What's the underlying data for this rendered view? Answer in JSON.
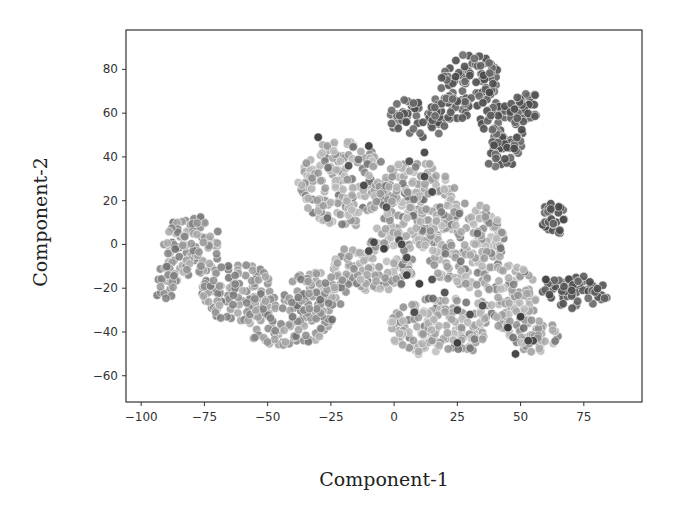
{
  "chart_data": {
    "type": "scatter",
    "title": "",
    "xlabel": "Component-1",
    "ylabel": "Component-2",
    "xlim": [
      -106,
      98
    ],
    "ylim": [
      -72,
      98
    ],
    "xticks": [
      -100,
      -75,
      -50,
      -25,
      0,
      25,
      50,
      75
    ],
    "xtick_labels": [
      "−100",
      "−75",
      "−50",
      "−25",
      "0",
      "25",
      "50",
      "75"
    ],
    "yticks": [
      -60,
      -40,
      -20,
      0,
      20,
      40,
      60,
      80
    ],
    "ytick_labels": [
      "−60",
      "−40",
      "−20",
      "0",
      "20",
      "40",
      "60",
      "80"
    ],
    "grid": false,
    "legend": null,
    "colormap": "grayscale",
    "marker_size": 6.5,
    "clusters": [
      {
        "name": "top-right dark cluster",
        "shade": "dark",
        "regions": [
          {
            "cx": 10,
            "cy": 58,
            "rx": 12,
            "ry": 10,
            "n": 55
          },
          {
            "cx": 30,
            "cy": 75,
            "rx": 12,
            "ry": 12,
            "n": 80
          },
          {
            "cx": 42,
            "cy": 50,
            "rx": 9,
            "ry": 16,
            "n": 80
          },
          {
            "cx": 52,
            "cy": 62,
            "rx": 7,
            "ry": 8,
            "n": 30
          },
          {
            "cx": 22,
            "cy": 62,
            "rx": 8,
            "ry": 6,
            "n": 30
          }
        ]
      },
      {
        "name": "right small dark cluster",
        "shade": "dark",
        "regions": [
          {
            "cx": 63,
            "cy": 12,
            "rx": 5,
            "ry": 8,
            "n": 28
          }
        ]
      },
      {
        "name": "far-right dark cluster",
        "shade": "dark",
        "regions": [
          {
            "cx": 72,
            "cy": -22,
            "rx": 14,
            "ry": 8,
            "n": 60
          }
        ]
      },
      {
        "name": "central light cluster",
        "shade": "light",
        "regions": [
          {
            "cx": -20,
            "cy": 28,
            "rx": 18,
            "ry": 20,
            "n": 190
          },
          {
            "cx": 8,
            "cy": 18,
            "rx": 18,
            "ry": 20,
            "n": 190
          },
          {
            "cx": 28,
            "cy": 0,
            "rx": 16,
            "ry": 20,
            "n": 170
          },
          {
            "cx": -8,
            "cy": -10,
            "rx": 16,
            "ry": 12,
            "n": 110
          },
          {
            "cx": 18,
            "cy": -38,
            "rx": 20,
            "ry": 14,
            "n": 160
          },
          {
            "cx": 45,
            "cy": -25,
            "rx": 12,
            "ry": 16,
            "n": 90
          },
          {
            "cx": 55,
            "cy": -42,
            "rx": 10,
            "ry": 8,
            "n": 40
          }
        ]
      },
      {
        "name": "left light cluster",
        "shade": "mid",
        "regions": [
          {
            "cx": -80,
            "cy": 0,
            "rx": 12,
            "ry": 14,
            "n": 100
          },
          {
            "cx": -90,
            "cy": -18,
            "rx": 5,
            "ry": 8,
            "n": 25
          },
          {
            "cx": -62,
            "cy": -22,
            "rx": 14,
            "ry": 14,
            "n": 110
          },
          {
            "cx": -42,
            "cy": -35,
            "rx": 18,
            "ry": 12,
            "n": 110
          },
          {
            "cx": -30,
            "cy": -22,
            "rx": 12,
            "ry": 10,
            "n": 60
          }
        ]
      }
    ],
    "highlighted_dark_points": [
      [
        -30,
        49
      ],
      [
        -18,
        36
      ],
      [
        -12,
        27
      ],
      [
        -3,
        17
      ],
      [
        -10,
        45
      ],
      [
        12,
        42
      ],
      [
        -8,
        1
      ],
      [
        -4,
        -2
      ],
      [
        2,
        2
      ],
      [
        5,
        -6
      ],
      [
        3,
        0
      ],
      [
        -10,
        -3
      ],
      [
        5,
        -14
      ],
      [
        10,
        -18
      ],
      [
        15,
        -16
      ],
      [
        20,
        -22
      ],
      [
        25,
        -30
      ],
      [
        30,
        -32
      ],
      [
        25,
        -45
      ],
      [
        35,
        -28
      ],
      [
        45,
        -38
      ],
      [
        50,
        -33
      ],
      [
        48,
        -50
      ],
      [
        55,
        -44
      ],
      [
        60,
        -16
      ],
      [
        53,
        -44
      ],
      [
        8,
        -31
      ],
      [
        12,
        31
      ],
      [
        6,
        38
      ],
      [
        15,
        24
      ]
    ]
  }
}
